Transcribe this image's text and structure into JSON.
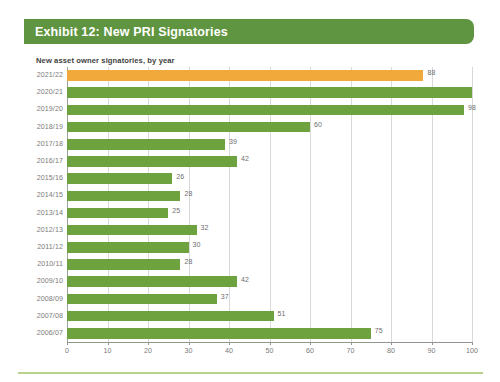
{
  "banner": {
    "title": "Exhibit 12: New PRI Signatories"
  },
  "subtitle": "New asset owner signatories, by year",
  "footer": {
    "rule_color": "#b9d18c"
  },
  "colors": {
    "banner_green": "#5f9540",
    "bar_green": "#6da23e",
    "bar_highlight_orange": "#f2a93b",
    "gridline": "#d9d9d9",
    "axis": "#8e948e",
    "label_gray": "#7b7b7b"
  },
  "chart_data": {
    "type": "bar",
    "orientation": "horizontal",
    "title": "Exhibit 12: New PRI Signatories",
    "subtitle": "New asset owner signatories, by year",
    "xlabel": "",
    "ylabel": "",
    "xlim": [
      0,
      100
    ],
    "xticks": [
      0,
      10,
      20,
      30,
      40,
      50,
      60,
      70,
      80,
      90,
      100
    ],
    "grid": true,
    "legend": false,
    "categories": [
      "2021/22",
      "2020/21",
      "2019/20",
      "2018/19",
      "2017/18",
      "2016/17",
      "2015/16",
      "2014/15",
      "2013/14",
      "2012/13",
      "2011/12",
      "2010/11",
      "2009/10",
      "2008/09",
      "2007/08",
      "2006/07"
    ],
    "values": [
      88,
      100,
      98,
      60,
      39,
      42,
      26,
      28,
      25,
      32,
      30,
      28,
      42,
      37,
      51,
      75
    ],
    "value_labels": [
      "88",
      "",
      "98",
      "60",
      "39",
      "42",
      "26",
      "28",
      "25",
      "32",
      "30",
      "28",
      "42",
      "37",
      "51",
      "75"
    ],
    "highlight_index": 0,
    "bar_color": "#6da23e",
    "highlight_color": "#f2a93b"
  }
}
